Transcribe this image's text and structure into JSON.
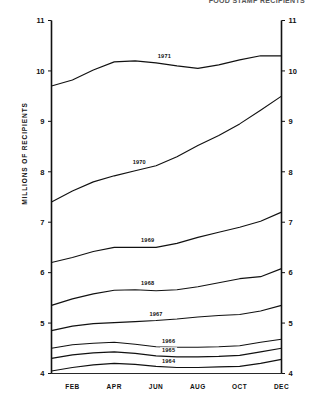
{
  "chart_title": "FOOD STAMP RECIPIENTS",
  "y_axis_title": "MILLIONS OF RECIPIENTS",
  "chart_data": {
    "type": "line",
    "title": "FOOD STAMP RECIPIENTS",
    "xlabel": "",
    "ylabel": "MILLIONS OF RECIPIENTS",
    "grid": false,
    "legend_position": "inline-labels",
    "x": [
      "JAN",
      "FEB",
      "MAR",
      "APR",
      "MAY",
      "JUN",
      "JUL",
      "AUG",
      "SEP",
      "OCT",
      "NOV",
      "DEC"
    ],
    "x_tick_labels": [
      "FEB",
      "APR",
      "JUN",
      "AUG",
      "OCT",
      "DEC"
    ],
    "y_tick_labels": [
      "4",
      "5",
      "6",
      "7",
      "8",
      "9",
      "10",
      "11"
    ],
    "ylim": [
      4,
      11
    ],
    "y_left_labels": [
      "11",
      "10",
      "9",
      "8",
      "7",
      "6",
      "5",
      "4"
    ],
    "y_right_labels": [
      "11",
      "10",
      "9",
      "8",
      "7",
      "6",
      "5",
      "4"
    ],
    "series": [
      {
        "name": "1971",
        "label": "1971",
        "values": [
          9.7,
          9.82,
          10.02,
          10.18,
          10.2,
          10.16,
          10.1,
          10.05,
          10.12,
          10.22,
          10.3,
          10.3
        ]
      },
      {
        "name": "1970",
        "label": "1970",
        "values": [
          7.4,
          7.62,
          7.8,
          7.92,
          8.02,
          8.12,
          8.3,
          8.52,
          8.72,
          8.95,
          9.22,
          9.5
        ]
      },
      {
        "name": "1969",
        "label": "1969",
        "values": [
          6.2,
          6.3,
          6.42,
          6.5,
          6.5,
          6.5,
          6.58,
          6.7,
          6.8,
          6.9,
          7.02,
          7.2
        ]
      },
      {
        "name": "1968",
        "label": "1968",
        "values": [
          5.35,
          5.48,
          5.58,
          5.65,
          5.66,
          5.64,
          5.66,
          5.72,
          5.8,
          5.88,
          5.92,
          6.08
        ]
      },
      {
        "name": "1967",
        "label": "1967",
        "values": [
          4.85,
          4.94,
          4.99,
          5.01,
          5.03,
          5.05,
          5.08,
          5.12,
          5.15,
          5.17,
          5.24,
          5.35
        ]
      },
      {
        "name": "1966",
        "label": "1966",
        "values": [
          4.5,
          4.57,
          4.6,
          4.62,
          4.58,
          4.53,
          4.52,
          4.52,
          4.53,
          4.55,
          4.62,
          4.68
        ]
      },
      {
        "name": "1965",
        "label": "1965",
        "values": [
          4.3,
          4.37,
          4.41,
          4.43,
          4.4,
          4.35,
          4.33,
          4.33,
          4.34,
          4.36,
          4.43,
          4.5
        ]
      },
      {
        "name": "1964",
        "label": "1964",
        "values": [
          4.05,
          4.12,
          4.17,
          4.2,
          4.18,
          4.14,
          4.12,
          4.12,
          4.13,
          4.14,
          4.2,
          4.28
        ]
      }
    ]
  }
}
